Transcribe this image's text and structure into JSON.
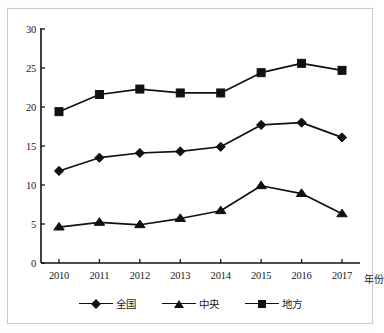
{
  "chart_data": {
    "type": "line",
    "title": "",
    "subtitle": "",
    "xlabel": "年份",
    "ylabel": "",
    "x": [
      2010,
      2011,
      2012,
      2013,
      2014,
      2015,
      2016,
      2017
    ],
    "categories": [
      "2010",
      "2011",
      "2012",
      "2013",
      "2014",
      "2015",
      "2016",
      "2017"
    ],
    "xtick_labels": [
      "2010",
      "2011",
      "2012",
      "2013",
      "2014",
      "2015",
      "2016",
      "2017"
    ],
    "ytick_labels": [
      "0",
      "5",
      "10",
      "15",
      "20",
      "25",
      "30"
    ],
    "yticks": [
      0,
      5,
      10,
      15,
      20,
      25,
      30
    ],
    "ylim": [
      0,
      30
    ],
    "grid": false,
    "legend_position": "bottom",
    "series": [
      {
        "name": "全国",
        "marker": "diamond",
        "color": "#111111",
        "values": [
          11.8,
          13.5,
          14.1,
          14.3,
          14.9,
          17.7,
          18.0,
          16.1
        ]
      },
      {
        "name": "中央",
        "marker": "triangle",
        "color": "#111111",
        "values": [
          4.6,
          5.2,
          4.9,
          5.7,
          6.7,
          9.9,
          8.9,
          6.3
        ]
      },
      {
        "name": "地方",
        "marker": "square",
        "color": "#111111",
        "values": [
          19.4,
          21.6,
          22.3,
          21.8,
          21.8,
          24.4,
          25.6,
          24.7
        ]
      }
    ]
  },
  "colors": {
    "line": "#111111",
    "axis": "#111111",
    "frame": "#c9c9c9",
    "background": "#ffffff",
    "text": "#1a1a1a"
  }
}
